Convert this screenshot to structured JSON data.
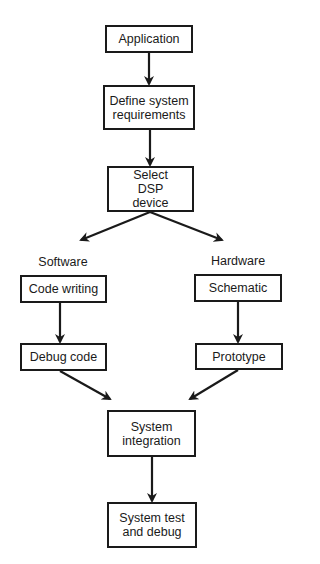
{
  "diagram": {
    "type": "flowchart",
    "nodes": {
      "application": "Application",
      "define": "Define system requirements",
      "select": "Select DSP device",
      "code_writing": "Code writing",
      "debug_code": "Debug code",
      "schematic": "Schematic",
      "prototype": "Prototype",
      "integration": "System integration",
      "test": "System test and debug"
    },
    "branch_labels": {
      "software": "Software",
      "hardware": "Hardware"
    },
    "edges": [
      [
        "application",
        "define"
      ],
      [
        "define",
        "select"
      ],
      [
        "select",
        "code_writing"
      ],
      [
        "select",
        "schematic"
      ],
      [
        "code_writing",
        "debug_code"
      ],
      [
        "schematic",
        "prototype"
      ],
      [
        "debug_code",
        "integration"
      ],
      [
        "prototype",
        "integration"
      ],
      [
        "integration",
        "test"
      ]
    ]
  }
}
